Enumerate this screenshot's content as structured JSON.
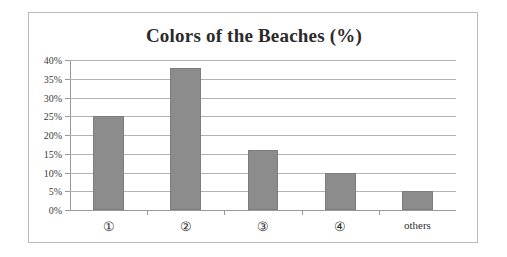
{
  "chart_data": {
    "type": "bar",
    "title": "Colors of the Beaches (%)",
    "xlabel": "",
    "ylabel": "",
    "categories": [
      "①",
      "②",
      "③",
      "④",
      "others"
    ],
    "values": [
      25,
      38,
      16,
      10,
      5
    ],
    "ylim": [
      0,
      40
    ],
    "ytick_values": [
      0,
      5,
      10,
      15,
      20,
      25,
      30,
      35,
      40
    ],
    "ytick_labels": [
      "0%",
      "5%",
      "10%",
      "15%",
      "20%",
      "25%",
      "30%",
      "35%",
      "40%"
    ],
    "grid": true,
    "legend": null,
    "series": [
      {
        "name": "Colors of the Beaches (%)",
        "values": [
          25,
          38,
          16,
          10,
          5
        ]
      }
    ],
    "colors": {
      "bar_fill": "#8c8c8c",
      "bar_stroke": "#7d7d7d",
      "gridline": "#b2b2b2",
      "axis": "#9a9a9a",
      "frame": "#b9b9b9",
      "text": "#2b2b2b",
      "background": "#ffffff"
    }
  }
}
